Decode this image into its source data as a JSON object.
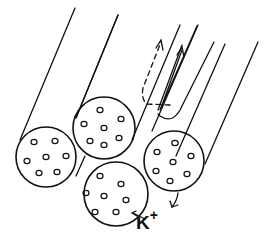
{
  "figure": {
    "label": {
      "ion": "K",
      "charge": "+"
    },
    "colors": {
      "stroke": "#111111",
      "background": "#ffffff"
    },
    "cylinders": [
      {
        "id": "left",
        "dots": 7
      },
      {
        "id": "top-middle",
        "dots": 7
      },
      {
        "id": "bottom-middle",
        "dots": 7
      },
      {
        "id": "right",
        "dots": 7
      }
    ],
    "arrows": [
      {
        "id": "dashed-up",
        "style": "dashed",
        "direction": "up along fiber"
      },
      {
        "id": "solid-up",
        "style": "solid",
        "direction": "up along fiber, U-turn"
      },
      {
        "id": "right-down",
        "style": "solid",
        "direction": "down from right cylinder"
      },
      {
        "id": "k-pointer",
        "style": "solid",
        "direction": "toward bottom-middle cylinder"
      }
    ]
  }
}
